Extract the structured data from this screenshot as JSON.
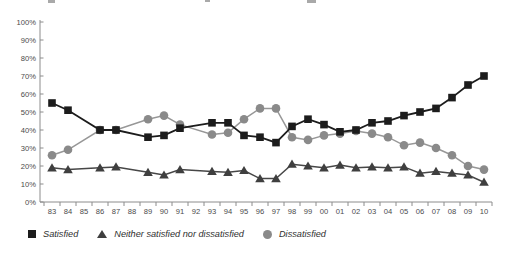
{
  "page": {
    "background": "#ffffff"
  },
  "chart_data": {
    "type": "line",
    "title": "",
    "xlabel": "",
    "ylabel": "",
    "ylim": [
      0,
      100
    ],
    "grid": false,
    "legend_position": "bottom-left",
    "x_categories": [
      "83",
      "84",
      "85",
      "86",
      "87",
      "88",
      "89",
      "90",
      "91",
      "92",
      "93",
      "94",
      "95",
      "96",
      "97",
      "98",
      "99",
      "00",
      "01",
      "02",
      "03",
      "04",
      "05",
      "06",
      "07",
      "08",
      "09",
      "10"
    ],
    "y_tick_labels": [
      "0%",
      "10%",
      "20%",
      "30%",
      "40%",
      "50%",
      "60%",
      "70%",
      "80%",
      "90%",
      "100%"
    ],
    "series": [
      {
        "name": "Satisfied",
        "marker": "square",
        "color": "#1c1c1c",
        "line_color": "#1c1c1c",
        "values": [
          55,
          51,
          null,
          40,
          40,
          null,
          36,
          37,
          41,
          null,
          44,
          44,
          37,
          36,
          33,
          42,
          46,
          43,
          39,
          40,
          44,
          45,
          48,
          50,
          52,
          58,
          65,
          70
        ]
      },
      {
        "name": "Neither satisfied nor dissatisfied",
        "marker": "triangle",
        "color": "#3f3f3f",
        "line_color": "#474747",
        "values": [
          19,
          18,
          null,
          19,
          19.5,
          null,
          16.5,
          15,
          18,
          null,
          17,
          16.5,
          17.5,
          13,
          13,
          21,
          20,
          19,
          20.5,
          19,
          19.5,
          19,
          19.5,
          16,
          17,
          16,
          15,
          11
        ]
      },
      {
        "name": "Dissatisfied",
        "marker": "circle",
        "color": "#8a8a8a",
        "line_color": "#979797",
        "values": [
          26,
          29,
          null,
          40,
          40,
          null,
          46,
          48,
          43,
          null,
          37.5,
          38.5,
          46,
          52,
          52,
          36,
          34.5,
          37,
          38,
          39.5,
          38,
          36,
          31.5,
          33,
          30,
          26,
          20,
          18
        ]
      }
    ],
    "axis_color": "#8c8c8c"
  }
}
